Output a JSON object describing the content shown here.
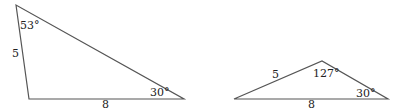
{
  "diagram": {
    "triangles": [
      {
        "id": "left",
        "vertices": {
          "top": [
            16,
            5
          ],
          "bottom_left": [
            29,
            99
          ],
          "bottom_right": [
            184,
            99
          ]
        },
        "labels": {
          "angle_top": "53°",
          "side_left": "5",
          "side_bottom": "8",
          "angle_bottom_right": "30°"
        }
      },
      {
        "id": "right",
        "vertices": {
          "left": [
            234,
            99
          ],
          "apex": [
            322,
            61
          ],
          "right": [
            388,
            99
          ]
        },
        "labels": {
          "side_left": "5",
          "angle_apex": "127°",
          "side_bottom": "8",
          "angle_right": "30°"
        }
      }
    ],
    "colors": {
      "stroke": "#555555",
      "text": "#222222",
      "background": "#ffffff"
    }
  }
}
